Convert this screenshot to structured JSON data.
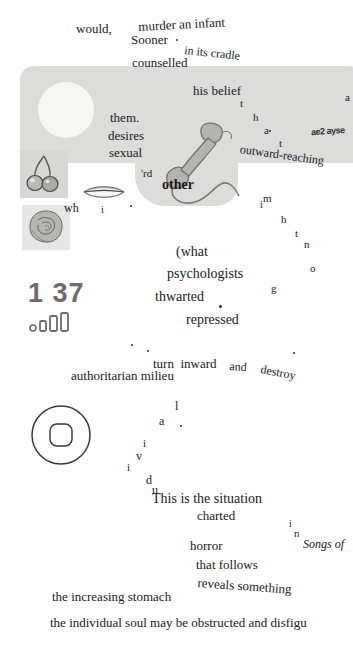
{
  "page": {
    "page_number": "1 37",
    "background_color": "#fefefe",
    "panel_color": "#dcdcda"
  },
  "status": {
    "clock_label": "1 37",
    "signal_icon": "signal-bars-icon",
    "home_icon": "home-button-icon"
  },
  "images": [
    {
      "name": "lips-illustration",
      "caption": "lips"
    },
    {
      "name": "cherries-illustration",
      "caption": "cherries"
    },
    {
      "name": "rose-illustration",
      "caption": "rose"
    },
    {
      "name": "telephone-handset-illustration",
      "caption": "telephone handset with cord"
    }
  ],
  "lines": [
    {
      "id": "l01",
      "text": "would,",
      "x": 76,
      "y": 22,
      "size": 13,
      "rot": 0,
      "style": "normal"
    },
    {
      "id": "l02",
      "text": "murder an infant",
      "x": 138,
      "y": 20,
      "size": 13,
      "rot": -3,
      "style": "normal"
    },
    {
      "id": "l03",
      "text": "Sooner",
      "x": 131,
      "y": 33,
      "size": 13,
      "rot": 0,
      "style": "normal"
    },
    {
      "id": "l04",
      "text": "in its cradle",
      "x": 185,
      "y": 44,
      "size": 12,
      "rot": 6,
      "style": "normal"
    },
    {
      "id": "l05",
      "text": "counselled",
      "x": 132,
      "y": 56,
      "size": 13,
      "rot": 0,
      "style": "normal"
    },
    {
      "id": "l06",
      "text": "them.",
      "x": 110,
      "y": 111,
      "size": 13,
      "rot": 0,
      "style": "normal"
    },
    {
      "id": "l07",
      "text": "his belief",
      "x": 193,
      "y": 84,
      "size": 13,
      "rot": 0,
      "style": "normal"
    },
    {
      "id": "l08",
      "text": "desires",
      "x": 108,
      "y": 129,
      "size": 13,
      "rot": 0,
      "style": "normal"
    },
    {
      "id": "l09",
      "text": "sexual",
      "x": 109,
      "y": 146,
      "size": 13,
      "rot": 0,
      "style": "normal"
    },
    {
      "id": "l10",
      "text": "outward-reaching",
      "x": 241,
      "y": 143,
      "size": 12,
      "rot": 8,
      "style": "normal"
    },
    {
      "id": "l11",
      "text": "other",
      "x": 162,
      "y": 178,
      "size": 14,
      "rot": 0,
      "style": "bold"
    },
    {
      "id": "l12",
      "text": "'rd",
      "x": 141,
      "y": 168,
      "size": 11,
      "rot": 0,
      "style": "normal"
    },
    {
      "id": "l13",
      "text": "wh",
      "x": 64,
      "y": 202,
      "size": 12,
      "rot": 0,
      "style": "normal"
    },
    {
      "id": "l14",
      "text": "(what",
      "x": 176,
      "y": 245,
      "size": 14,
      "rot": 0,
      "style": "normal"
    },
    {
      "id": "l15",
      "text": "psychologists",
      "x": 167,
      "y": 267,
      "size": 14,
      "rot": 0,
      "style": "normal"
    },
    {
      "id": "l16",
      "text": "thwarted",
      "x": 155,
      "y": 290,
      "size": 14,
      "rot": 0,
      "style": "normal"
    },
    {
      "id": "l17",
      "text": "repressed",
      "x": 186,
      "y": 313,
      "size": 14,
      "rot": 0,
      "style": "normal"
    },
    {
      "id": "l18",
      "text": "turn  inward",
      "x": 153,
      "y": 357,
      "size": 13,
      "rot": 0,
      "style": "normal"
    },
    {
      "id": "l19",
      "text": "and",
      "x": 230,
      "y": 360,
      "size": 12,
      "rot": 4,
      "style": "normal"
    },
    {
      "id": "l20",
      "text": "destroy",
      "x": 262,
      "y": 363,
      "size": 12,
      "rot": 11,
      "style": "normal"
    },
    {
      "id": "l21",
      "text": "authoritarian milieu",
      "x": 71,
      "y": 369,
      "size": 13,
      "rot": 0,
      "style": "normal"
    },
    {
      "id": "l22",
      "text": "This is the situation",
      "x": 152,
      "y": 492,
      "size": 14,
      "rot": 0,
      "style": "normal"
    },
    {
      "id": "l23",
      "text": "charted",
      "x": 197,
      "y": 509,
      "size": 13,
      "rot": 0,
      "style": "normal"
    },
    {
      "id": "l24",
      "text": "horror",
      "x": 190,
      "y": 539,
      "size": 13,
      "rot": 0,
      "style": "normal"
    },
    {
      "id": "l25",
      "text": "Songs of",
      "x": 303,
      "y": 538,
      "size": 12,
      "rot": 0,
      "style": "italic"
    },
    {
      "id": "l26",
      "text": "that follows",
      "x": 196,
      "y": 558,
      "size": 13,
      "rot": 0,
      "style": "normal"
    },
    {
      "id": "l27",
      "text": "reveals something",
      "x": 198,
      "y": 576,
      "size": 13,
      "rot": 4,
      "style": "normal"
    },
    {
      "id": "l28",
      "text": "the increasing stomach",
      "x": 52,
      "y": 590,
      "size": 13,
      "rot": 0,
      "style": "normal"
    },
    {
      "id": "l29",
      "text": "the individual soul may be obstructed and disfigu",
      "x": 50,
      "y": 616,
      "size": 13,
      "rot": 0,
      "style": "normal"
    }
  ],
  "scattered_letters": [
    {
      "id": "s01",
      "text": "a",
      "x": 345,
      "y": 92,
      "size": 11
    },
    {
      "id": "s02",
      "text": "t",
      "x": 240,
      "y": 98,
      "size": 11
    },
    {
      "id": "s03",
      "text": "h",
      "x": 253,
      "y": 112,
      "size": 11
    },
    {
      "id": "s04",
      "text": "a",
      "x": 264,
      "y": 125,
      "size": 11
    },
    {
      "id": "s05",
      "text": "t",
      "x": 279,
      "y": 138,
      "size": 11
    },
    {
      "id": "s06",
      "text": "m",
      "x": 263,
      "y": 193,
      "size": 11
    },
    {
      "id": "s07",
      "text": "i",
      "x": 260,
      "y": 200,
      "size": 10
    },
    {
      "id": "s08",
      "text": "h",
      "x": 281,
      "y": 214,
      "size": 11
    },
    {
      "id": "s09",
      "text": "t",
      "x": 295,
      "y": 228,
      "size": 11
    },
    {
      "id": "s10",
      "text": "n",
      "x": 304,
      "y": 239,
      "size": 11
    },
    {
      "id": "s11",
      "text": "o",
      "x": 310,
      "y": 263,
      "size": 11
    },
    {
      "id": "s12",
      "text": "g",
      "x": 271,
      "y": 283,
      "size": 11
    },
    {
      "id": "s13",
      "text": "i",
      "x": 101,
      "y": 205,
      "size": 10
    },
    {
      "id": "s14",
      "text": "l",
      "x": 175,
      "y": 400,
      "size": 12
    },
    {
      "id": "s15",
      "text": "a",
      "x": 159,
      "y": 415,
      "size": 12
    },
    {
      "id": "s16",
      "text": "i",
      "x": 143,
      "y": 438,
      "size": 11
    },
    {
      "id": "s17",
      "text": "v",
      "x": 136,
      "y": 450,
      "size": 12
    },
    {
      "id": "s18",
      "text": "i",
      "x": 127,
      "y": 462,
      "size": 11
    },
    {
      "id": "s19",
      "text": "d",
      "x": 146,
      "y": 474,
      "size": 12
    },
    {
      "id": "s20",
      "text": "u",
      "x": 152,
      "y": 484,
      "size": 12
    },
    {
      "id": "s21",
      "text": "i",
      "x": 289,
      "y": 519,
      "size": 10
    },
    {
      "id": "s22",
      "text": "n",
      "x": 294,
      "y": 528,
      "size": 11
    }
  ],
  "specks": [
    {
      "id": "p1",
      "x": 176,
      "y": 39,
      "size": 2
    },
    {
      "id": "p2",
      "x": 269,
      "y": 130,
      "size": 2
    },
    {
      "id": "p3",
      "x": 130,
      "y": 205,
      "size": 2
    },
    {
      "id": "p4",
      "x": 219,
      "y": 305,
      "size": 3
    },
    {
      "id": "p5",
      "x": 131,
      "y": 344,
      "size": 2
    },
    {
      "id": "p6",
      "x": 147,
      "y": 350,
      "size": 2
    },
    {
      "id": "p7",
      "x": 293,
      "y": 352,
      "size": 2
    },
    {
      "id": "p8",
      "x": 180,
      "y": 425,
      "size": 2
    }
  ],
  "smudge": {
    "text": "ae2 ayse"
  }
}
